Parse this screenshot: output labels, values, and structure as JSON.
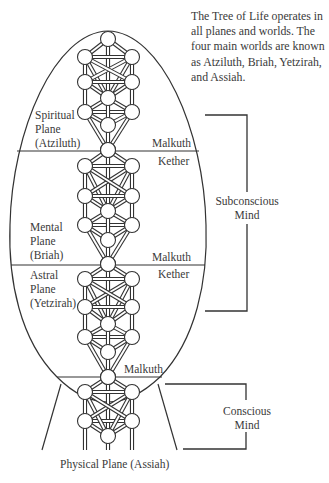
{
  "caption": {
    "lines": [
      "The Tree of Life operates in",
      "all planes and worlds. The",
      "four main worlds are known",
      "as Atziluth, Briah, Yetzirah,",
      "and Assiah."
    ]
  },
  "planes": {
    "spiritual": {
      "line1": "Spiritual",
      "line2": "Plane",
      "line3": "(Atziluth)"
    },
    "mental": {
      "line1": "Mental",
      "line2": "Plane",
      "line3": "(Briah)"
    },
    "astral": {
      "line1": "Astral",
      "line2": "Plane",
      "line3": "(Yetzirah)"
    },
    "physical": "Physical Plane (Assiah)"
  },
  "sephirot_labels": {
    "malkuth_1": "Malkuth",
    "kether_2": "Kether",
    "malkuth_2": "Malkuth",
    "kether_3": "Kether",
    "malkuth_3": "Malkuth"
  },
  "brackets": {
    "subconscious": {
      "line1": "Subconscious",
      "line2": "Mind"
    },
    "conscious": {
      "line1": "Conscious",
      "line2": "Mind"
    }
  },
  "colors": {
    "line": "#333333",
    "text": "#3a3a3a",
    "background": "#ffffff"
  }
}
